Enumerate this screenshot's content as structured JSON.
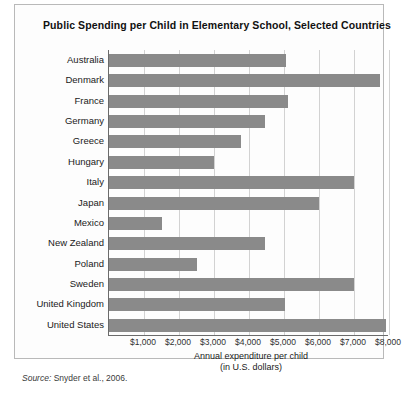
{
  "figure": {
    "title": "Public Spending per Child in Elementary School, Selected Countries",
    "source_label": "Source:",
    "source_text": " Snyder et al., 2006.",
    "bar_color": "#8a8a8a",
    "grid_color": "#d2d2d2",
    "axis_color": "#6b6b6b",
    "panel_border_color": "#b9b9b9",
    "background": "#ffffff"
  },
  "chart_data": {
    "type": "bar",
    "orientation": "horizontal",
    "title": "Public Spending per Child in Elementary School, Selected Countries",
    "xlabel": "Annual expenditure per child",
    "xlabel_line2": "(in U.S. dollars)",
    "ylabel": "",
    "xlim": [
      0,
      7970
    ],
    "ylim": null,
    "grid": true,
    "grid_axis": "x",
    "legend": false,
    "legend_position": "none",
    "tick_labels": [
      "$1,000",
      "$2,000",
      "$3,000",
      "$4,000",
      "$5,000",
      "$6,000",
      "$7,000",
      "$8,000"
    ],
    "tick_values": [
      1000,
      2000,
      3000,
      4000,
      5000,
      6000,
      7000,
      8000
    ],
    "categories": [
      "Australia",
      "Denmark",
      "France",
      "Germany",
      "Greece",
      "Hungary",
      "Italy",
      "Japan",
      "Mexico",
      "New Zealand",
      "Poland",
      "Sweden",
      "United Kingdom",
      "United States"
    ],
    "values": [
      5050,
      7730,
      5100,
      4470,
      3760,
      3010,
      7000,
      6010,
      1500,
      4470,
      2500,
      7000,
      5040,
      7900
    ],
    "units": "U.S. dollars"
  }
}
